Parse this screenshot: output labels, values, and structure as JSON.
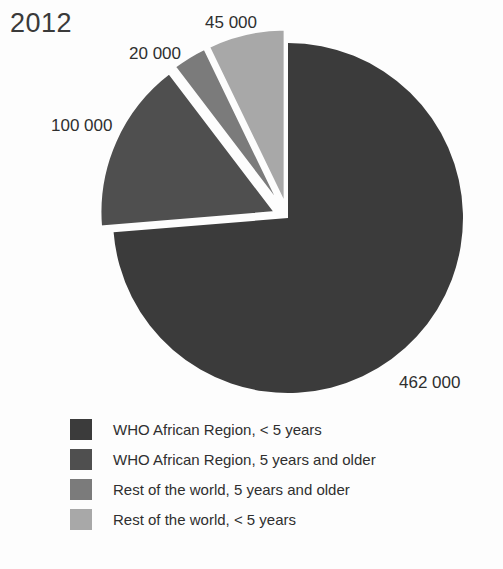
{
  "chart_data": {
    "type": "pie",
    "title": "2012",
    "total": 627000,
    "labels": [
      "WHO African Region, < 5 years",
      "WHO African Region, 5 years and older",
      "Rest of the world, 5 years and older",
      "Rest of the world, < 5 years"
    ],
    "values": [
      462000,
      100000,
      20000,
      45000
    ],
    "value_labels": [
      "462 000",
      "100 000",
      "20 000",
      "45 000"
    ],
    "colors": [
      "#3b3b3b",
      "#4f4f4f",
      "#7b7b7b",
      "#a8a8a8"
    ],
    "exploded": [
      false,
      true,
      true,
      true
    ],
    "start_angle_deg": 0,
    "direction": "clockwise",
    "legend_position": "bottom-left",
    "grid": false,
    "xlabel": "",
    "ylabel": ""
  },
  "chart": {
    "title": "2012",
    "slices": [
      {
        "value_label": "462 000",
        "value": 462000,
        "color": "#3b3b3b",
        "start": 0,
        "sweep": 265.3,
        "explode": 0
      },
      {
        "value_label": "100 000",
        "value": 100000,
        "color": "#4f4f4f",
        "start": 265.3,
        "sweep": 57.4,
        "explode": 14
      },
      {
        "value_label": "20 000",
        "value": 20000,
        "color": "#7b7b7b",
        "start": 322.7,
        "sweep": 11.5,
        "explode": 14
      },
      {
        "value_label": "45 000",
        "value": 45000,
        "color": "#a8a8a8",
        "start": 334.2,
        "sweep": 25.8,
        "explode": 14
      }
    ],
    "geometry": {
      "cx": 288,
      "cy": 218,
      "r": 175
    }
  },
  "legend": {
    "items": [
      {
        "label": "WHO African Region, < 5 years",
        "color": "#3b3b3b"
      },
      {
        "label": "WHO African Region, 5 years and older",
        "color": "#4f4f4f"
      },
      {
        "label": "Rest of the world, 5 years and older",
        "color": "#7b7b7b"
      },
      {
        "label": "Rest of the world, < 5 years",
        "color": "#a8a8a8"
      }
    ]
  }
}
